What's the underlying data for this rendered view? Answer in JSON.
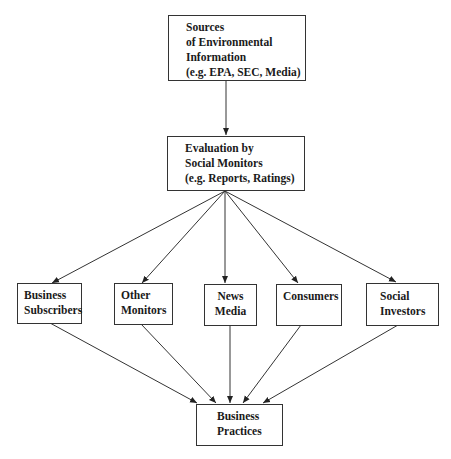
{
  "diagram": {
    "type": "flowchart",
    "nodes": [
      {
        "id": "sources",
        "lines": [
          "Sources",
          "of Environmental",
          "Information",
          "(e.g. EPA, SEC, Media)"
        ]
      },
      {
        "id": "evaluation",
        "lines": [
          "Evaluation by",
          "Social Monitors",
          "(e.g. Reports, Ratings)"
        ]
      },
      {
        "id": "business_subscribers",
        "lines": [
          "Business",
          "Subscribers"
        ]
      },
      {
        "id": "other_monitors",
        "lines": [
          "Other",
          "Monitors"
        ]
      },
      {
        "id": "news_media",
        "lines": [
          "News",
          "Media"
        ]
      },
      {
        "id": "consumers",
        "lines": [
          "Consumers"
        ]
      },
      {
        "id": "social_investors",
        "lines": [
          "Social",
          "Investors"
        ]
      },
      {
        "id": "business_practices",
        "lines": [
          "Business",
          "Practices"
        ]
      }
    ],
    "edges": [
      {
        "from": "sources",
        "to": "evaluation"
      },
      {
        "from": "evaluation",
        "to": "business_subscribers"
      },
      {
        "from": "evaluation",
        "to": "other_monitors"
      },
      {
        "from": "evaluation",
        "to": "news_media"
      },
      {
        "from": "evaluation",
        "to": "consumers"
      },
      {
        "from": "evaluation",
        "to": "social_investors"
      },
      {
        "from": "business_subscribers",
        "to": "business_practices"
      },
      {
        "from": "other_monitors",
        "to": "business_practices"
      },
      {
        "from": "news_media",
        "to": "business_practices"
      },
      {
        "from": "consumers",
        "to": "business_practices"
      },
      {
        "from": "social_investors",
        "to": "business_practices"
      }
    ]
  }
}
